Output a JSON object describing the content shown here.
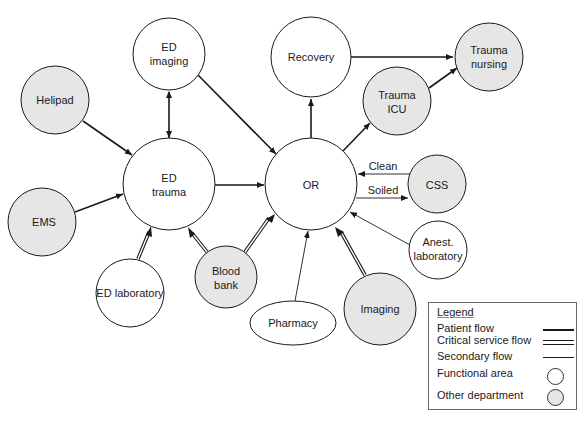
{
  "colors": {
    "functional_fill": "#ffffff",
    "department_fill": "#e6e6e6",
    "stroke": "#1a1a1a"
  },
  "nodes": {
    "helipad": {
      "label": [
        "Helipad"
      ],
      "type": "other-department"
    },
    "ems": {
      "label": [
        "EMS"
      ],
      "type": "other-department"
    },
    "ed_imaging": {
      "label": [
        "ED",
        "imaging"
      ],
      "type": "functional-area"
    },
    "ed_trauma": {
      "label": [
        "ED",
        "trauma"
      ],
      "type": "functional-area"
    },
    "recovery": {
      "label": [
        "Recovery"
      ],
      "type": "functional-area"
    },
    "trauma_nursing": {
      "label": [
        "Trauma",
        "nursing"
      ],
      "type": "other-department"
    },
    "trauma_icu": {
      "label": [
        "Trauma",
        "ICU"
      ],
      "type": "other-department"
    },
    "or": {
      "label": [
        "OR"
      ],
      "type": "functional-area"
    },
    "css": {
      "label": [
        "CSS"
      ],
      "type": "other-department"
    },
    "anest_lab": {
      "label": [
        "Anest.",
        "laboratory"
      ],
      "type": "functional-area"
    },
    "ed_lab": {
      "label": [
        "ED laboratory"
      ],
      "type": "functional-area"
    },
    "blood_bank": {
      "label": [
        "Blood",
        "bank"
      ],
      "type": "other-department"
    },
    "pharmacy": {
      "label": [
        "Pharmacy"
      ],
      "type": "functional-area"
    },
    "imaging": {
      "label": [
        "Imaging"
      ],
      "type": "other-department"
    }
  },
  "edge_labels": {
    "clean": "Clean",
    "soiled": "Soiled"
  },
  "edges": [
    {
      "from": "Helipad",
      "to": "ED trauma",
      "kind": "patient"
    },
    {
      "from": "EMS",
      "to": "ED trauma",
      "kind": "patient"
    },
    {
      "from": "ED imaging",
      "to": "ED trauma",
      "kind": "patient",
      "bidirectional": true
    },
    {
      "from": "ED imaging",
      "to": "OR",
      "kind": "patient"
    },
    {
      "from": "ED trauma",
      "to": "OR",
      "kind": "patient"
    },
    {
      "from": "OR",
      "to": "Recovery",
      "kind": "patient"
    },
    {
      "from": "OR",
      "to": "Trauma ICU",
      "kind": "patient"
    },
    {
      "from": "Recovery",
      "to": "Trauma nursing",
      "kind": "patient"
    },
    {
      "from": "Trauma ICU",
      "to": "Trauma nursing",
      "kind": "patient"
    },
    {
      "from": "CSS",
      "to": "OR",
      "kind": "secondary",
      "label": "Clean"
    },
    {
      "from": "OR",
      "to": "CSS",
      "kind": "secondary",
      "label": "Soiled"
    },
    {
      "from": "Anest. laboratory",
      "to": "OR",
      "kind": "secondary"
    },
    {
      "from": "Pharmacy",
      "to": "OR",
      "kind": "secondary"
    },
    {
      "from": "ED laboratory",
      "to": "ED trauma",
      "kind": "critical"
    },
    {
      "from": "Blood bank",
      "to": "ED trauma",
      "kind": "critical"
    },
    {
      "from": "Blood bank",
      "to": "OR",
      "kind": "critical"
    },
    {
      "from": "Imaging",
      "to": "OR",
      "kind": "critical"
    }
  ],
  "legend": {
    "title": "Legend",
    "items": [
      {
        "label": "Patient flow",
        "symbol": "thick-line"
      },
      {
        "label": "Critical service flow",
        "symbol": "double-line"
      },
      {
        "label": "Secondary flow",
        "symbol": "thin-line"
      },
      {
        "label": "Functional area",
        "symbol": "white-circle"
      },
      {
        "label": "Other department",
        "symbol": "gray-circle"
      }
    ]
  }
}
